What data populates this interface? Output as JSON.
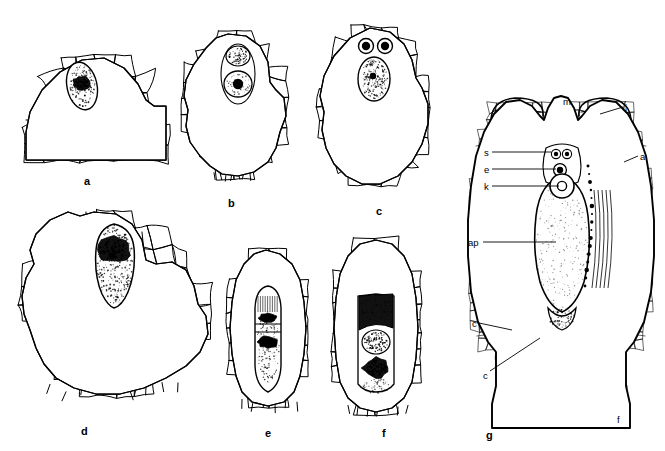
{
  "figure": {
    "kind": "scientific-line-drawing",
    "background_color": "#ffffff",
    "ink_color": "#000000",
    "width": 665,
    "height": 451
  },
  "panels": [
    {
      "id": "a",
      "label": "a",
      "label_x": 84,
      "label_y": 176,
      "caption": "Dome of gametophyte tissue with a single enlarged, densely stippled archegonial initial cell near the apex",
      "box": {
        "x": 20,
        "y": 28,
        "w": 150,
        "h": 145
      }
    },
    {
      "id": "b",
      "label": "b",
      "label_x": 228,
      "label_y": 198,
      "caption": "Elongate gametophyte apex containing two superposed nuclei: an upper stippled nucleus and a lower nucleus with a dark nucleolus",
      "box": {
        "x": 176,
        "y": 30,
        "w": 118,
        "h": 160
      }
    },
    {
      "id": "c",
      "label": "c",
      "label_x": 376,
      "label_y": 206,
      "caption": "Gametophyte apex with a pair of small dark neck cells above a large stippled central cell",
      "box": {
        "x": 310,
        "y": 24,
        "w": 128,
        "h": 172
      }
    },
    {
      "id": "d",
      "label": "d",
      "label_x": 81,
      "label_y": 426,
      "caption": "Broad lobed gametophyte tissue enclosing a large flask-shaped archegonium with coarse dark contents",
      "box": {
        "x": 16,
        "y": 206,
        "w": 200,
        "h": 205
      }
    },
    {
      "id": "e",
      "label": "e",
      "label_x": 265,
      "label_y": 428,
      "caption": "Narrow archegonium with two stacked dark nuclei inside the central canal",
      "box": {
        "x": 222,
        "y": 246,
        "w": 90,
        "h": 168
      }
    },
    {
      "id": "f",
      "label": "f",
      "label_x": 382,
      "label_y": 428,
      "caption": "Archegonium with heavily stained upper cell and two dark stippled nuclei below",
      "box": {
        "x": 326,
        "y": 236,
        "w": 100,
        "h": 180
      }
    },
    {
      "id": "g",
      "label": "g",
      "label_x": 486,
      "label_y": 430,
      "caption": "Complete ovule in longitudinal section showing integument, micropyle, archegonium with egg nucleus, and the cellular nucellus and chalaza",
      "box": {
        "x": 462,
        "y": 86,
        "w": 196,
        "h": 340
      }
    }
  ],
  "g_annotations": [
    {
      "key": "m",
      "text": "m",
      "x": 563,
      "y": 97,
      "meaning": "micropyle",
      "leader": null
    },
    {
      "key": "i",
      "text": "i",
      "x": 625,
      "y": 103,
      "meaning": "integument",
      "leader": {
        "x1": 623,
        "y1": 107,
        "x2": 600,
        "y2": 114
      }
    },
    {
      "key": "a",
      "text": "a",
      "x": 640,
      "y": 152,
      "meaning": "outer wall / apex region",
      "leader": {
        "x1": 638,
        "y1": 156,
        "x2": 624,
        "y2": 162
      }
    },
    {
      "key": "s",
      "text": "s",
      "x": 484,
      "y": 148,
      "meaning": "neck / stalk cells",
      "leader": {
        "x1": 492,
        "y1": 152,
        "x2": 551,
        "y2": 152
      }
    },
    {
      "key": "e",
      "text": "e",
      "x": 484,
      "y": 165,
      "meaning": "egg / ventral canal cell",
      "leader": {
        "x1": 492,
        "y1": 169,
        "x2": 556,
        "y2": 169
      }
    },
    {
      "key": "k",
      "text": "k",
      "x": 484,
      "y": 182,
      "meaning": "egg nucleus",
      "leader": {
        "x1": 492,
        "y1": 186,
        "x2": 559,
        "y2": 186
      }
    },
    {
      "key": "ap",
      "text": "ap",
      "x": 468,
      "y": 238,
      "meaning": "archegonium base / apical region",
      "leader": {
        "x1": 483,
        "y1": 242,
        "x2": 556,
        "y2": 242
      }
    },
    {
      "key": "c1",
      "text": "c",
      "x": 472,
      "y": 319,
      "meaning": "chalaza",
      "leader": {
        "x1": 479,
        "y1": 323,
        "x2": 512,
        "y2": 330
      }
    },
    {
      "key": "c2",
      "text": "c",
      "x": 483,
      "y": 371,
      "meaning": "chalaza",
      "leader": {
        "x1": 490,
        "y1": 371,
        "x2": 540,
        "y2": 338
      }
    },
    {
      "key": "f",
      "text": "f",
      "x": 617,
      "y": 415,
      "meaning": "funicle / stalk",
      "leader": null
    }
  ]
}
